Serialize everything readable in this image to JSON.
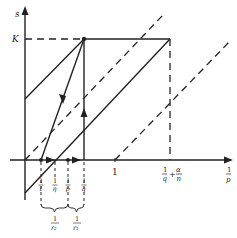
{
  "diagram": {
    "axes": {
      "y_label": "s",
      "x_label_num": "1",
      "x_label_den": "p"
    },
    "y_ticks": [
      {
        "label": "K"
      }
    ],
    "x_ticks_main": [
      {
        "label": "1"
      },
      {
        "num": "1",
        "den": "q",
        "plus": "+",
        "num2": "α",
        "den2": "n"
      }
    ],
    "x_ticks_below": [
      {
        "num": "1",
        "den": "t"
      },
      {
        "num": "1",
        "den": "η"
      },
      {
        "num": "1",
        "den": "p"
      },
      {
        "num": "1",
        "den": "q"
      }
    ],
    "braces": [
      {
        "num": "1",
        "den": "r₂"
      },
      {
        "num": "1",
        "den": "r₁"
      }
    ],
    "colors": {
      "ink": "#222222",
      "background": "#ffffff"
    }
  }
}
